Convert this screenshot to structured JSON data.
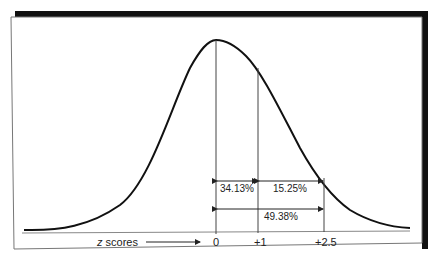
{
  "figure": {
    "axis_label_var": "z",
    "axis_label_text": "scores",
    "ticks": [
      {
        "label": "0",
        "z": 0
      },
      {
        "label": "+1",
        "z": 1
      },
      {
        "label": "+2.5",
        "z": 2.5
      }
    ],
    "intervals": [
      {
        "label": "34.13%",
        "from": "0",
        "to": "+1"
      },
      {
        "label": "15.25%",
        "from": "+1",
        "to": "+2.5"
      },
      {
        "label": "49.38%",
        "from": "0",
        "to": "+2.5"
      }
    ],
    "colors": {
      "curve": "#111111",
      "frame": "#777777",
      "shadow": "#111111",
      "lines": "#444444"
    }
  }
}
